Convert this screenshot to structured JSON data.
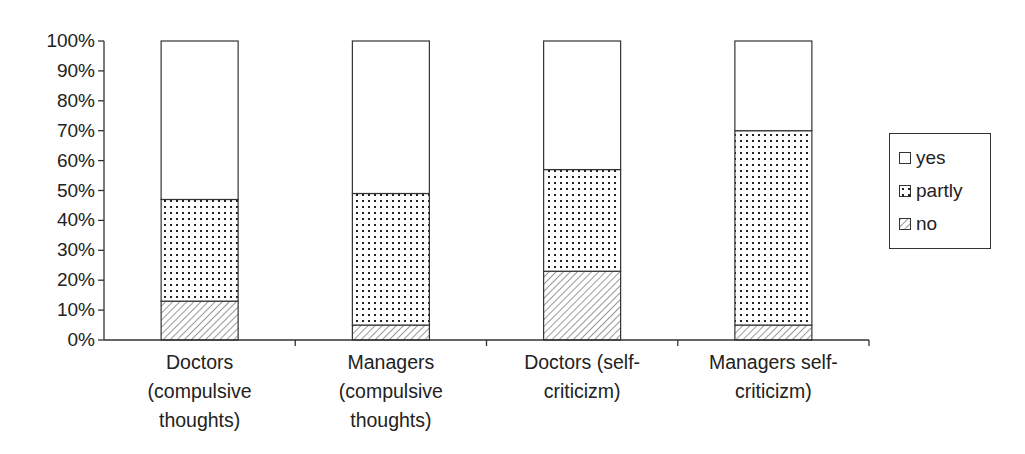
{
  "chart_data": {
    "type": "bar",
    "stacked": true,
    "percent_stacked": true,
    "title": "",
    "xlabel": "",
    "ylabel": "",
    "ylim": [
      0,
      100
    ],
    "yticks": [
      "0%",
      "10%",
      "20%",
      "30%",
      "40%",
      "50%",
      "60%",
      "70%",
      "80%",
      "90%",
      "100%"
    ],
    "categories": [
      "Doctors (compulsive thoughts)",
      "Managers (compulsive thoughts)",
      "Doctors (self-criticizm)",
      "Managers self-criticizm)"
    ],
    "category_label_lines": [
      "Doctors\n(compulsive\nthoughts)",
      "Managers\n(compulsive\nthoughts)",
      "Doctors (self-\ncriticizm)",
      "Managers self-\ncriticizm)"
    ],
    "series": [
      {
        "name": "no",
        "pattern": "diagonal-hatch",
        "values": [
          13,
          5,
          23,
          5
        ]
      },
      {
        "name": "partly",
        "pattern": "dots",
        "values": [
          34,
          44,
          34,
          65
        ]
      },
      {
        "name": "yes",
        "pattern": "blank",
        "values": [
          53,
          51,
          43,
          30
        ]
      }
    ],
    "cumulative_tops": {
      "no": [
        13,
        5,
        23,
        5
      ],
      "partly": [
        47,
        49,
        57,
        70
      ],
      "yes": [
        100,
        100,
        100,
        100
      ]
    },
    "legend": {
      "position": "right",
      "entries": [
        "yes",
        "partly",
        "no"
      ]
    },
    "grid": false
  },
  "colors": {
    "axis": "#333333",
    "background": "#ffffff",
    "fill": "#ffffff",
    "pattern": "#333333"
  }
}
